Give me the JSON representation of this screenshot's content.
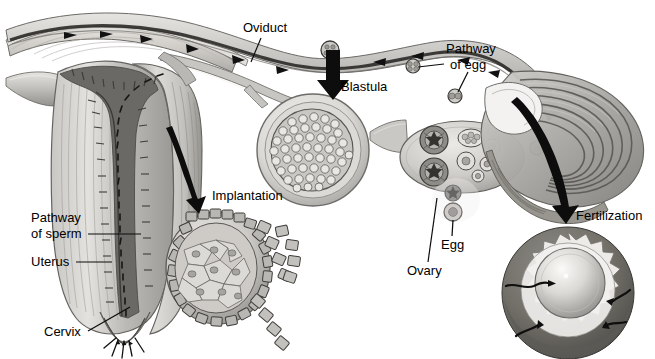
{
  "figure": {
    "style": "grayscale anatomical illustration",
    "palette": {
      "background": "#ffffff",
      "ink": "#000000",
      "tissue_light": "#d8d6d2",
      "tissue_mid": "#b0aeaa",
      "tissue_dark": "#7d7b78",
      "cavity_dark": "#5d5b59",
      "highlight": "#efeeec"
    }
  },
  "labels": [
    {
      "id": "oviduct",
      "text": "Oviduct",
      "x": 243,
      "y": 21,
      "align": "left"
    },
    {
      "id": "pathway-of-egg-1",
      "text": "Pathway",
      "x": 446,
      "y": 42,
      "align": "left"
    },
    {
      "id": "pathway-of-egg-2",
      "text": "of egg",
      "x": 450,
      "y": 58,
      "align": "left"
    },
    {
      "id": "blastula",
      "text": "Blastula",
      "x": 341,
      "y": 80,
      "align": "left"
    },
    {
      "id": "implantation",
      "text": "Implantation",
      "x": 212,
      "y": 189,
      "align": "left"
    },
    {
      "id": "pathway-of-sperm-1",
      "text": "Pathway",
      "x": 31,
      "y": 211,
      "align": "left"
    },
    {
      "id": "pathway-of-sperm-2",
      "text": "of sperm",
      "x": 31,
      "y": 227,
      "align": "left"
    },
    {
      "id": "fertilization",
      "text": "Fertilization",
      "x": 576,
      "y": 209,
      "align": "left"
    },
    {
      "id": "egg",
      "text": "Egg",
      "x": 441,
      "y": 238,
      "align": "left"
    },
    {
      "id": "uterus",
      "text": "Uterus",
      "x": 31,
      "y": 255,
      "align": "left"
    },
    {
      "id": "ovary",
      "text": "Ovary",
      "x": 407,
      "y": 264,
      "align": "left"
    },
    {
      "id": "cervix",
      "text": "Cervix",
      "x": 44,
      "y": 325,
      "align": "left"
    }
  ],
  "structures": [
    {
      "id": "uterus-body",
      "name": "Uterus (cut-away showing endometrium and cavity)"
    },
    {
      "id": "cervix-opening",
      "name": "Cervix with sperm entering"
    },
    {
      "id": "oviduct-tube",
      "name": "Oviduct / fallopian tube"
    },
    {
      "id": "ovary-body",
      "name": "Ovary with follicles and corpora lutea"
    },
    {
      "id": "fimbriae",
      "name": "Fimbriated infundibulum"
    },
    {
      "id": "blastula-inset",
      "name": "Blastula cross-section inset"
    },
    {
      "id": "implantation-inset",
      "name": "Implanting blastocyst inset"
    },
    {
      "id": "fertilization-inset",
      "name": "Fertilization inset: sperm meeting egg"
    },
    {
      "id": "egg-stages",
      "name": "Developing egg stages along oviduct"
    }
  ],
  "annotation_arrows": [
    {
      "id": "arrow-blastula",
      "kind": "straight-down",
      "from": [
        331,
        50
      ],
      "to": [
        335,
        96
      ]
    },
    {
      "id": "arrow-implantation",
      "kind": "curved",
      "from": [
        170,
        126
      ],
      "to": [
        200,
        203
      ]
    },
    {
      "id": "arrow-fertilization",
      "kind": "curved",
      "from": [
        517,
        96
      ],
      "to": [
        566,
        216
      ]
    }
  ],
  "leader_lines": [
    {
      "id": "leader-oviduct",
      "from": [
        262,
        37
      ],
      "to": [
        252,
        60
      ]
    },
    {
      "id": "leader-pathway-of-egg",
      "from": [
        446,
        64
      ],
      "to": [
        416,
        66
      ]
    },
    {
      "id": "leader-pathway-of-egg-2",
      "from": [
        466,
        72
      ],
      "to": [
        455,
        95
      ]
    },
    {
      "id": "leader-pathway-of-sperm",
      "from": [
        88,
        234
      ],
      "to": [
        140,
        234
      ]
    },
    {
      "id": "leader-uterus",
      "from": [
        77,
        262
      ],
      "to": [
        112,
        262
      ]
    },
    {
      "id": "leader-cervix",
      "from": [
        89,
        331
      ],
      "to": [
        130,
        306
      ]
    },
    {
      "id": "leader-egg",
      "from": [
        451,
        236
      ],
      "to": [
        453,
        212
      ]
    },
    {
      "id": "leader-ovary",
      "from": [
        428,
        262
      ],
      "to": [
        438,
        198
      ]
    }
  ]
}
